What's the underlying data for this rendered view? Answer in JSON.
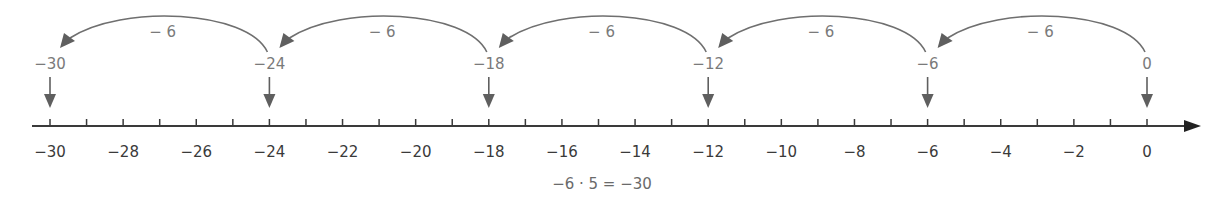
{
  "chart_data": {
    "type": "number-line",
    "title": "",
    "axis": {
      "min": -30,
      "max": 0,
      "minor_step": 1,
      "label_step": 2,
      "tick_labels": [
        "-30",
        "-28",
        "-26",
        "-24",
        "-22",
        "-20",
        "-18",
        "-16",
        "-14",
        "-12",
        "-10",
        "-8",
        "-6",
        "-4",
        "-2",
        "0"
      ],
      "arrow_direction": "right"
    },
    "jumps": [
      {
        "from": 0,
        "to": -6,
        "label": "− 6"
      },
      {
        "from": -6,
        "to": -12,
        "label": "− 6"
      },
      {
        "from": -12,
        "to": -18,
        "label": "− 6"
      },
      {
        "from": -18,
        "to": -24,
        "label": "− 6"
      },
      {
        "from": -24,
        "to": -30,
        "label": "− 6"
      }
    ],
    "marked_points": [
      {
        "value": -30,
        "label": "−30"
      },
      {
        "value": -24,
        "label": "−24"
      },
      {
        "value": -18,
        "label": "−18"
      },
      {
        "value": -12,
        "label": "−12"
      },
      {
        "value": -6,
        "label": "−6"
      },
      {
        "value": 0,
        "label": "0"
      }
    ],
    "equation": "−6 · 5 = −30"
  },
  "colors": {
    "axis": "#3a3a3a",
    "arc": "#6f6f6f",
    "arrow_fill": "#5f5f5f",
    "label_gray": "#7a7a7a"
  },
  "tick_labels_display": [
    "−30",
    "−28",
    "−26",
    "−24",
    "−22",
    "−20",
    "−18",
    "−16",
    "−14",
    "−12",
    "−10",
    "−8",
    "−6",
    "−4",
    "−2",
    "0"
  ]
}
